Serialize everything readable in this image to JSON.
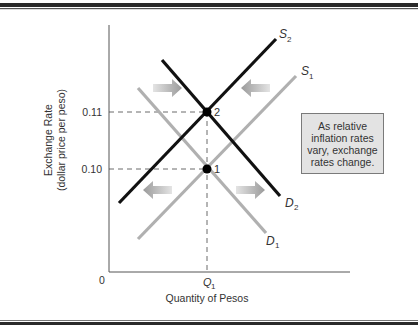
{
  "figure": {
    "y_axis_label_line1": "Exchange Rate",
    "y_axis_label_line2": "(dollar price per peso)",
    "x_axis_label": "Quantity of Pesos",
    "origin_label": "0",
    "y_ticks": [
      "0.11",
      "0.10"
    ],
    "x_tick": {
      "main": "Q",
      "sub": "1"
    },
    "curves": [
      {
        "id": "S2",
        "main": "S",
        "sub": "2",
        "color": "#111111"
      },
      {
        "id": "S1",
        "main": "S",
        "sub": "1",
        "color": "#b0b0b0"
      },
      {
        "id": "D2",
        "main": "D",
        "sub": "2",
        "color": "#111111"
      },
      {
        "id": "D1",
        "main": "D",
        "sub": "1",
        "color": "#b0b0b0"
      }
    ],
    "points": [
      {
        "label": "2",
        "exchange_rate": 0.11,
        "quantity": "Q1"
      },
      {
        "label": "1",
        "exchange_rate": 0.1,
        "quantity": "Q1"
      }
    ],
    "shift_arrows": [
      {
        "direction": "right",
        "curve": "demand",
        "from": "D1",
        "to": "D2"
      },
      {
        "direction": "left",
        "curve": "supply",
        "from": "S1",
        "to": "S2"
      }
    ],
    "note": "As relative inflation rates vary, exchange rates change.",
    "colors": {
      "new_curve": "#111111",
      "old_curve": "#b0b0b0",
      "arrow": "#a8a8a8",
      "note_bg": "#e3e3e3"
    }
  }
}
